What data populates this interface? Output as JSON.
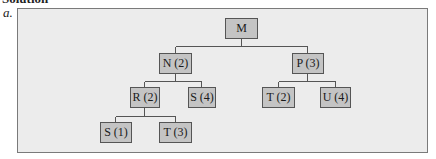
{
  "heading": "Solution",
  "part_label": "a.",
  "tree": {
    "root": {
      "label": "M"
    },
    "nodes": {
      "M": {
        "label": "M"
      },
      "N": {
        "label": "N (2)"
      },
      "P": {
        "label": "P (3)"
      },
      "R": {
        "label": "R (2)"
      },
      "S4": {
        "label": "S (4)"
      },
      "T2": {
        "label": "T (2)"
      },
      "U4": {
        "label": "U (4)"
      },
      "S1": {
        "label": "S (1)"
      },
      "T3": {
        "label": "T (3)"
      }
    },
    "edges": [
      [
        "M",
        "N"
      ],
      [
        "M",
        "P"
      ],
      [
        "N",
        "R"
      ],
      [
        "N",
        "S4"
      ],
      [
        "P",
        "T2"
      ],
      [
        "P",
        "U4"
      ],
      [
        "R",
        "S1"
      ],
      [
        "R",
        "T3"
      ]
    ]
  },
  "colors": {
    "frame_bg": "#ececec",
    "frame_border": "#7a7a7a",
    "node_bg": "#c4c4c4",
    "node_border": "#555555",
    "line": "#555555"
  }
}
